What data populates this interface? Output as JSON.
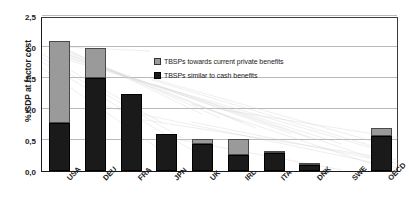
{
  "chart_data": {
    "type": "bar",
    "stacked": true,
    "title": "",
    "xlabel": "",
    "ylabel": "% GDP at factor cost",
    "ylim": [
      0,
      2.5
    ],
    "ytick_labels": [
      "0,0",
      "0,5",
      "1,0",
      "1,5",
      "2,0",
      "2,5"
    ],
    "ytick_values": [
      0,
      0.5,
      1.0,
      1.5,
      2.0,
      2.5
    ],
    "grid": true,
    "legend_position": "inside-upper-right",
    "categories": [
      "USA",
      "DEU",
      "FRA",
      "JPN",
      "UK",
      "IRL",
      "ITA",
      "DNK",
      "SWE",
      "OECD"
    ],
    "series": [
      {
        "name": "TBSPs similar to cash benefits",
        "color": "#1a1a1a",
        "values": [
          0.78,
          1.5,
          1.25,
          0.6,
          0.43,
          0.26,
          0.29,
          0.1,
          0.0,
          0.57
        ]
      },
      {
        "name": "TBSPs towards current private benefits",
        "color": "#9a9a9a",
        "values": [
          1.31,
          0.48,
          0.0,
          0.0,
          0.09,
          0.26,
          0.01,
          0.02,
          0.0,
          0.13
        ]
      }
    ],
    "totals": [
      2.09,
      1.98,
      1.25,
      0.6,
      0.52,
      0.52,
      0.3,
      0.12,
      0.0,
      0.7
    ]
  },
  "legend": {
    "items": [
      {
        "label": "TBSPs towards current private benefits",
        "swatch": "gray-swatch-icon"
      },
      {
        "label": "TBSPs similar to cash benefits",
        "swatch": "black-swatch-icon"
      }
    ]
  },
  "axis": {
    "y_title": "% GDP at factor cost"
  }
}
